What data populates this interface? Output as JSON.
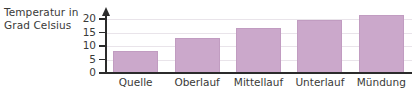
{
  "chart_data": {
    "type": "bar",
    "title": "",
    "xlabel": "",
    "ylabel": "Temperatur in Grad Celsius",
    "categories": [
      "Quelle",
      "Oberlauf",
      "Mittellauf",
      "Unterlauf",
      "Mündung"
    ],
    "values": [
      8,
      12.8,
      16.7,
      19.6,
      21.4
    ],
    "ylim": [
      0,
      23
    ],
    "yticks": [
      0,
      5,
      10,
      15,
      20
    ],
    "ytick_labels": [
      "0",
      "5",
      "10",
      "15",
      "20"
    ],
    "grid": true,
    "legend": "none",
    "bar_color": "#cba8cb",
    "axis_color": "#2b2b2b",
    "text_color": "#3a3a38",
    "gridline_color": "#e9e4ea",
    "background": "#ffffff"
  },
  "axis_title": {
    "line1": "Temperatur in",
    "line2": "Grad Celsius"
  }
}
